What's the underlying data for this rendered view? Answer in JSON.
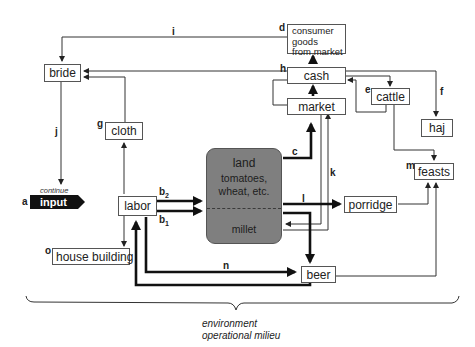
{
  "diagram": {
    "type": "flow",
    "nodes": {
      "bride": "bride",
      "cloth": "cloth",
      "consumer_goods": [
        "consumer",
        "goods",
        "from market"
      ],
      "cash": "cash",
      "market": "market",
      "cattle": "cattle",
      "haj": "haj",
      "feasts": "feasts",
      "porridge": "porridge",
      "beer": "beer",
      "labor": "labor",
      "house_building": "house building",
      "land": {
        "title": "land",
        "upper": [
          "tomatoes,",
          "wheat, etc."
        ],
        "lower": "millet"
      },
      "input": "input",
      "input_caption": "continue"
    },
    "edge_labels": {
      "a": "a",
      "b1": "b",
      "b1_sub": "1",
      "b2": "b",
      "b2_sub": "2",
      "c": "c",
      "d": "d",
      "e": "e",
      "f": "f",
      "g": "g",
      "h": "h",
      "i": "i",
      "j": "j",
      "k": "k",
      "l": "l",
      "m": "m",
      "n": "n",
      "o": "o"
    },
    "environment": [
      "environment",
      "operational milieu"
    ]
  }
}
